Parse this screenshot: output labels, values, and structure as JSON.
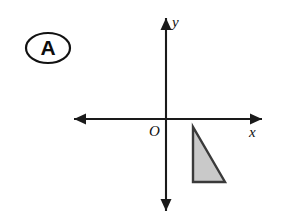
{
  "figure": {
    "label_badge": {
      "text": "A",
      "shape": "ellipse",
      "center_x": 48,
      "center_y": 48,
      "rx": 22,
      "ry": 15
    },
    "canvas": {
      "width": 281,
      "height": 218,
      "background_color": "#ffffff"
    },
    "axes": {
      "color": "#1a1a1a",
      "origin_label": "O",
      "origin_label_x": 149,
      "origin_label_y": 136,
      "origin_x": 166,
      "origin_y": 119,
      "x_axis": {
        "label": "x",
        "label_x": 249,
        "label_y": 137,
        "start_x": 74,
        "end_x": 262,
        "y": 119,
        "arrow_left": true,
        "arrow_right": true
      },
      "y_axis": {
        "label": "y",
        "label_x": 172,
        "label_y": 27,
        "start_y": 18,
        "end_y": 211,
        "x": 166,
        "arrow_up": true,
        "arrow_down": true
      }
    },
    "shapes": [
      {
        "name": "right-triangle",
        "type": "polygon",
        "points": "193,127 193,182 225,182",
        "fill_color": "#c9c9c9",
        "stroke_color": "#3a3a3a",
        "stroke_width": 2.4,
        "quadrant": "IV",
        "vertices": [
          {
            "x": 193,
            "y": 127
          },
          {
            "x": 193,
            "y": 182
          },
          {
            "x": 225,
            "y": 182
          }
        ]
      }
    ],
    "arrow_heads": {
      "x_left": "74,119 84,114 84,124",
      "x_right": "262,119 252,114 252,124",
      "y_up": "166,18 161,28 171,28",
      "y_down": "166,211 161,201 171,201"
    }
  }
}
